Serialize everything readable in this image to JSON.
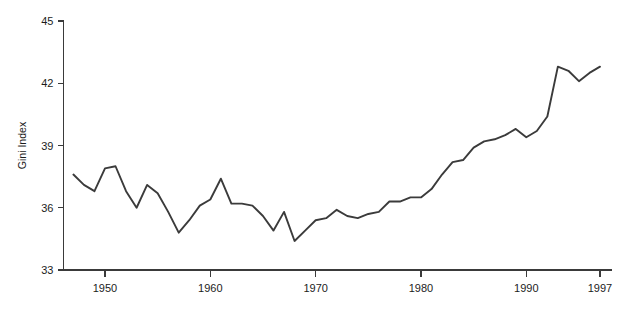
{
  "chart_data": {
    "type": "line",
    "title": "",
    "xlabel": "",
    "ylabel": "Gini Index",
    "xlim": [
      1946.5,
      1997.5
    ],
    "ylim": [
      33,
      45
    ],
    "grid": false,
    "legend": null,
    "y_ticks": [
      33,
      36,
      39,
      42,
      45
    ],
    "y_tick_labels": [
      "33",
      "36",
      "39",
      "42",
      "45"
    ],
    "x_ticks": [
      1950,
      1960,
      1970,
      1980,
      1990,
      1997
    ],
    "x_tick_labels": [
      "1950",
      "1960",
      "1970",
      "1980",
      "1990",
      "1997"
    ],
    "series": [
      {
        "name": "Gini Index",
        "color": "#3b3b3b",
        "x": [
          1947,
          1948,
          1949,
          1950,
          1951,
          1952,
          1953,
          1954,
          1955,
          1956,
          1957,
          1958,
          1959,
          1960,
          1961,
          1962,
          1963,
          1964,
          1965,
          1966,
          1967,
          1968,
          1969,
          1970,
          1971,
          1972,
          1973,
          1974,
          1975,
          1976,
          1977,
          1978,
          1979,
          1980,
          1981,
          1982,
          1983,
          1984,
          1985,
          1986,
          1987,
          1988,
          1989,
          1990,
          1991,
          1992,
          1993,
          1994,
          1995,
          1996,
          1997
        ],
        "values": [
          37.6,
          37.1,
          36.8,
          37.9,
          38.0,
          36.8,
          36.0,
          37.1,
          36.7,
          35.8,
          34.8,
          35.4,
          36.1,
          36.4,
          37.4,
          36.2,
          36.2,
          36.1,
          35.6,
          34.9,
          35.8,
          34.4,
          34.9,
          35.4,
          35.5,
          35.9,
          35.6,
          35.5,
          35.7,
          35.8,
          36.3,
          36.3,
          36.5,
          36.5,
          36.9,
          37.6,
          38.2,
          38.3,
          38.9,
          39.2,
          39.3,
          39.5,
          39.8,
          39.4,
          39.7,
          40.4,
          42.8,
          42.6,
          42.1,
          42.5,
          42.8
        ]
      }
    ]
  }
}
